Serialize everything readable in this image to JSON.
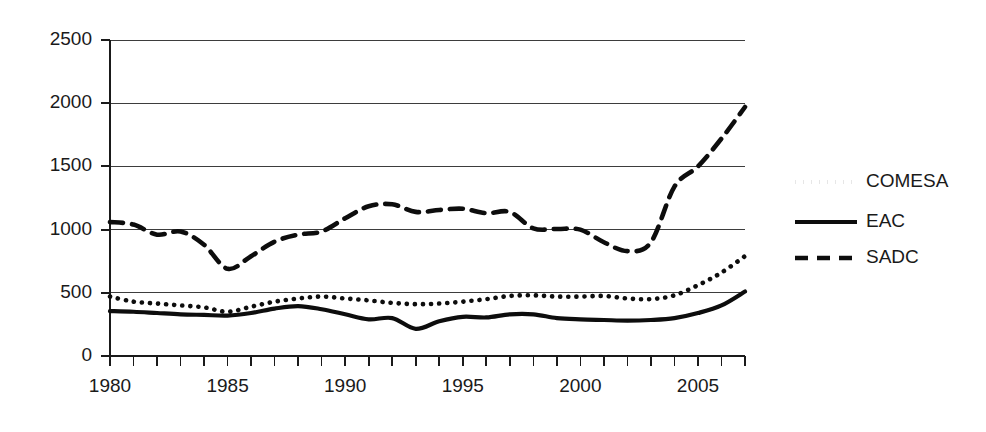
{
  "chart_data": {
    "type": "line",
    "title": "",
    "subtitle": "",
    "xlabel": "",
    "ylabel": "",
    "xlim": [
      1980,
      2007
    ],
    "ylim": [
      0,
      2500
    ],
    "grid": true,
    "gridlines_y": [
      0,
      500,
      1000,
      1500,
      2000,
      2500
    ],
    "ytick_labels": [
      "0",
      "500",
      "1000",
      "1500",
      "2000",
      "2500"
    ],
    "ytick_values": [
      0,
      500,
      1000,
      1500,
      2000,
      2500
    ],
    "xtick_labels": [
      "1980",
      "1985",
      "1990",
      "1995",
      "2000",
      "2005"
    ],
    "xtick_values": [
      1980,
      1985,
      1990,
      1995,
      2000,
      2005
    ],
    "xtick_minor_step": 1,
    "legend_position": "right",
    "x": [
      1980,
      1981,
      1982,
      1983,
      1984,
      1985,
      1986,
      1987,
      1988,
      1989,
      1990,
      1991,
      1992,
      1993,
      1994,
      1995,
      1996,
      1997,
      1998,
      1999,
      2000,
      2001,
      2002,
      2003,
      2004,
      2005,
      2006,
      2007
    ],
    "series": [
      {
        "name": "COMESA",
        "style": "dotted",
        "color": "#0d0d0d",
        "values": [
          470,
          430,
          415,
          400,
          385,
          350,
          390,
          430,
          455,
          470,
          455,
          440,
          420,
          410,
          415,
          430,
          450,
          475,
          480,
          470,
          470,
          475,
          455,
          450,
          480,
          560,
          660,
          790
        ]
      },
      {
        "name": "EAC",
        "style": "solid",
        "color": "#0d0d0d",
        "values": [
          355,
          350,
          340,
          330,
          325,
          320,
          340,
          375,
          395,
          370,
          330,
          290,
          300,
          215,
          275,
          310,
          305,
          330,
          330,
          300,
          290,
          285,
          280,
          285,
          300,
          340,
          400,
          510
        ]
      },
      {
        "name": "SADC",
        "style": "dashed",
        "color": "#0d0d0d",
        "values": [
          1060,
          1040,
          960,
          985,
          880,
          690,
          790,
          905,
          960,
          985,
          1090,
          1185,
          1200,
          1140,
          1155,
          1165,
          1130,
          1140,
          1010,
          1005,
          1000,
          900,
          830,
          900,
          1340,
          1500,
          1720,
          1970
        ]
      }
    ]
  },
  "legend": {
    "items": [
      {
        "label": "COMESA",
        "style": "dotted"
      },
      {
        "label": "EAC",
        "style": "solid"
      },
      {
        "label": "SADC",
        "style": "dashed"
      }
    ]
  }
}
